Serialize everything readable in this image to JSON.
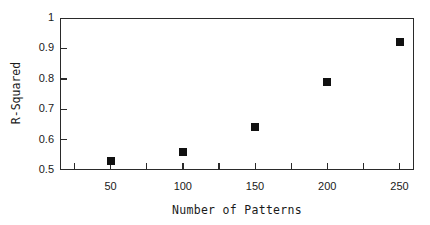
{
  "chart_data": {
    "type": "scatter",
    "title": "",
    "xlabel": "Number of Patterns",
    "ylabel": "R-Squared",
    "x": [
      50,
      100,
      150,
      200,
      250
    ],
    "y": [
      0.53,
      0.56,
      0.64,
      0.79,
      0.92
    ],
    "series": [
      {
        "name": "R-Squared",
        "marker": "filled-square",
        "color": "#111111",
        "points": [
          {
            "x": 50,
            "y": 0.53
          },
          {
            "x": 100,
            "y": 0.56
          },
          {
            "x": 150,
            "y": 0.64
          },
          {
            "x": 200,
            "y": 0.79
          },
          {
            "x": 250,
            "y": 0.92
          }
        ]
      }
    ],
    "xlim": [
      15,
      260
    ],
    "ylim": [
      0.5,
      1.0
    ],
    "xticks_major": [
      50,
      100,
      150,
      200,
      250
    ],
    "xticks_minor": [
      25,
      75,
      125,
      175,
      225
    ],
    "yticks": [
      0.5,
      0.6,
      0.7,
      0.8,
      0.9,
      1.0
    ],
    "ytick_labels": [
      "0.5",
      "0.6",
      "0.7",
      "0.8",
      "0.9",
      "1"
    ],
    "xtick_labels": [
      "50",
      "100",
      "150",
      "200",
      "250"
    ],
    "grid": false,
    "legend": null
  },
  "labels": {
    "x_axis_title": "Number of Patterns",
    "y_axis_title": "R-Squared"
  }
}
